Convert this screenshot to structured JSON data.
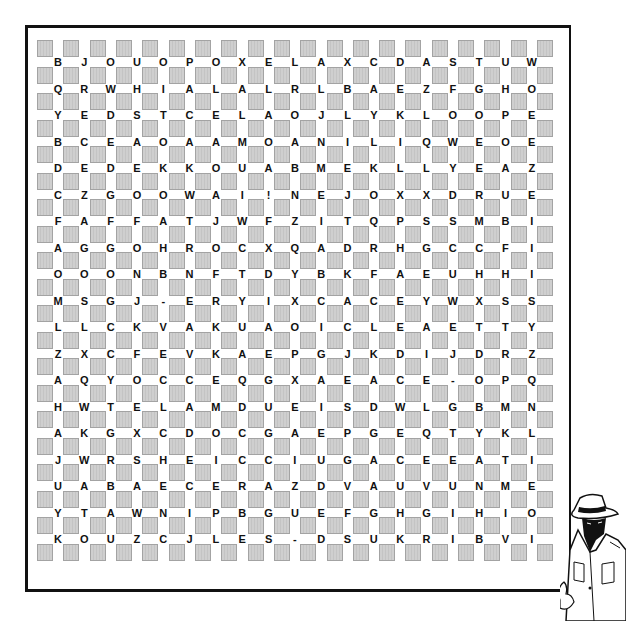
{
  "puzzle": {
    "type": "word-search",
    "box_color": "#cfcfcf",
    "letter_color": "#111111",
    "grid": [
      [
        "B",
        "J",
        "O",
        "U",
        "O",
        "P",
        "O",
        "X",
        "E",
        "L",
        "A",
        "X",
        "C",
        "D",
        "A",
        "S",
        "T",
        "U",
        "W"
      ],
      [
        "Q",
        "R",
        "W",
        "H",
        "I",
        "A",
        "L",
        "A",
        "L",
        "R",
        "L",
        "B",
        "A",
        "E",
        "Z",
        "F",
        "G",
        "H",
        "O"
      ],
      [
        "Y",
        "E",
        "D",
        "S",
        "T",
        "C",
        "E",
        "L",
        "A",
        "O",
        "J",
        "L",
        "Y",
        "K",
        "L",
        "O",
        "O",
        "P",
        "E"
      ],
      [
        "B",
        "C",
        "E",
        "A",
        "O",
        "A",
        "A",
        "M",
        "O",
        "A",
        "N",
        "I",
        "L",
        "I",
        "Q",
        "W",
        "E",
        "O",
        "E"
      ],
      [
        "D",
        "E",
        "D",
        "E",
        "K",
        "K",
        "O",
        "U",
        "A",
        "B",
        "M",
        "E",
        "K",
        "L",
        "L",
        "Y",
        "E",
        "A",
        "Z"
      ],
      [
        "C",
        "Z",
        "G",
        "O",
        "O",
        "W",
        "A",
        "I",
        "!",
        "N",
        "E",
        "J",
        "O",
        "X",
        "X",
        "D",
        "R",
        "U",
        "E"
      ],
      [
        "F",
        "A",
        "F",
        "F",
        "A",
        "T",
        "J",
        "W",
        "F",
        "Z",
        "I",
        "T",
        "Q",
        "P",
        "S",
        "S",
        "M",
        "B",
        "I"
      ],
      [
        "A",
        "G",
        "G",
        "O",
        "H",
        "R",
        "O",
        "C",
        "X",
        "Q",
        "A",
        "D",
        "R",
        "H",
        "G",
        "C",
        "C",
        "F",
        "I"
      ],
      [
        "O",
        "O",
        "O",
        "N",
        "B",
        "N",
        "F",
        "T",
        "D",
        "Y",
        "B",
        "K",
        "F",
        "A",
        "E",
        "U",
        "H",
        "H",
        "I"
      ],
      [
        "M",
        "S",
        "G",
        "J",
        "-",
        "E",
        "R",
        "Y",
        "I",
        "X",
        "C",
        "A",
        "C",
        "E",
        "Y",
        "W",
        "X",
        "S",
        "S"
      ],
      [
        "L",
        "L",
        "C",
        "K",
        "V",
        "A",
        "K",
        "U",
        "A",
        "O",
        "I",
        "C",
        "L",
        "E",
        "A",
        "E",
        "T",
        "T",
        "Y"
      ],
      [
        "Z",
        "X",
        "C",
        "F",
        "E",
        "V",
        "K",
        "A",
        "E",
        "P",
        "G",
        "J",
        "K",
        "D",
        "I",
        "J",
        "D",
        "R",
        "Z"
      ],
      [
        "A",
        "Q",
        "Y",
        "O",
        "C",
        "C",
        "E",
        "Q",
        "G",
        "X",
        "A",
        "E",
        "A",
        "C",
        "E",
        "-",
        "O",
        "P",
        "Q"
      ],
      [
        "H",
        "W",
        "T",
        "E",
        "L",
        "A",
        "M",
        "D",
        "U",
        "E",
        "I",
        "S",
        "D",
        "W",
        "L",
        "G",
        "B",
        "M",
        "N"
      ],
      [
        "A",
        "K",
        "G",
        "X",
        "C",
        "D",
        "O",
        "C",
        "G",
        "A",
        "E",
        "P",
        "G",
        "E",
        "Q",
        "T",
        "Y",
        "K",
        "L"
      ],
      [
        "J",
        "W",
        "R",
        "S",
        "H",
        "E",
        "I",
        "C",
        "C",
        "I",
        "U",
        "G",
        "A",
        "C",
        "E",
        "E",
        "A",
        "T",
        "I"
      ],
      [
        "U",
        "A",
        "B",
        "A",
        "E",
        "C",
        "E",
        "R",
        "A",
        "Z",
        "D",
        "V",
        "A",
        "U",
        "V",
        "U",
        "N",
        "M",
        "E"
      ],
      [
        "Y",
        "T",
        "A",
        "W",
        "N",
        "I",
        "P",
        "B",
        "G",
        "U",
        "E",
        "F",
        "G",
        "H",
        "G",
        "I",
        "H",
        "I",
        "O"
      ],
      [
        "K",
        "O",
        "U",
        "Z",
        "C",
        "J",
        "L",
        "E",
        "S",
        "-",
        "D",
        "S",
        "U",
        "K",
        "R",
        "I",
        "B",
        "V",
        "I"
      ]
    ]
  },
  "illustration": {
    "name": "detective-in-hat-and-trenchcoat"
  }
}
